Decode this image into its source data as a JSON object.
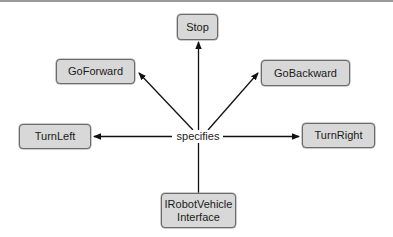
{
  "diagram": {
    "center": {
      "label": "specifies"
    },
    "source": {
      "label_line1": "IRobotVehicle",
      "label_line2": "Interface"
    },
    "targets": [
      {
        "id": "stop",
        "label": "Stop",
        "direction": "up"
      },
      {
        "id": "goforward",
        "label": "GoForward",
        "direction": "up-left"
      },
      {
        "id": "gobackward",
        "label": "GoBackward",
        "direction": "up-right"
      },
      {
        "id": "turnleft",
        "label": "TurnLeft",
        "direction": "left"
      },
      {
        "id": "turnright",
        "label": "TurnRight",
        "direction": "right"
      }
    ],
    "colors": {
      "node_fill": "#d8d8d8",
      "node_border": "#6b6b6b",
      "edge": "#111111",
      "background": "#ffffff"
    }
  }
}
